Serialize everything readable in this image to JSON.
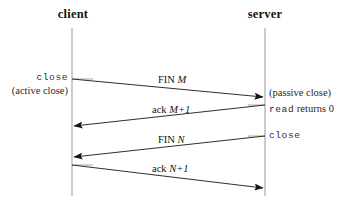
{
  "figure": {
    "background_color": "#ffffff",
    "line_color": "#3a3a3a",
    "lifeline_color": "#b8b8b8"
  },
  "actors": [
    {
      "id": "client",
      "label": "client",
      "x": 72
    },
    {
      "id": "server",
      "label": "server",
      "x": 265
    }
  ],
  "client_events": [
    {
      "id": "close",
      "label": "close",
      "style": "mono"
    },
    {
      "id": "active-close",
      "label": "(active close)",
      "style": "serif"
    }
  ],
  "server_events": [
    {
      "id": "passive-close",
      "label": "(passive close)",
      "style": "serif"
    },
    {
      "id": "read-returns",
      "label_mono": "read",
      "label_serif": " returns 0"
    },
    {
      "id": "close",
      "label": "close",
      "style": "mono"
    }
  ],
  "messages": [
    {
      "id": "fin-m",
      "label_roman": "FIN ",
      "label_italic": "M",
      "direction": "client-to-server",
      "from_y": 79,
      "to_y": 97
    },
    {
      "id": "ack-m-plus-1",
      "label_roman": "ack ",
      "label_italic": "M+1",
      "direction": "server-to-client",
      "from_y": 105,
      "to_y": 126
    },
    {
      "id": "fin-n",
      "label_roman": "FIN ",
      "label_italic": "N",
      "direction": "server-to-client",
      "from_y": 136,
      "to_y": 157
    },
    {
      "id": "ack-n-plus-1",
      "label_roman": "ack ",
      "label_italic": "N+1",
      "direction": "client-to-server",
      "from_y": 165,
      "to_y": 188
    }
  ],
  "lifelines": {
    "top": 28,
    "bottom": 196
  }
}
